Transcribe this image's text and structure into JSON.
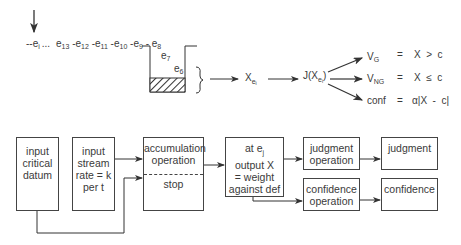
{
  "top": {
    "stream_prefix": "--e",
    "stream_prefix_sub": "i",
    "ellipsis": "...",
    "stream_elements": [
      {
        "base": "e",
        "sub": "13"
      },
      {
        "base": "-e",
        "sub": "12"
      },
      {
        "base": "-e",
        "sub": "11"
      },
      {
        "base": "-e",
        "sub": "10"
      },
      {
        "base": "-e",
        "sub": "9"
      },
      {
        "base": " - e",
        "sub": "8"
      }
    ],
    "container_items": [
      {
        "base": "e",
        "sub": "7"
      },
      {
        "base": "e",
        "sub": "6"
      }
    ],
    "x_label": {
      "base": "X",
      "sub": "e",
      "subsub": "i"
    },
    "j_label": {
      "base": "J(X",
      "sub": "e",
      "subsub": "i",
      "close": ")"
    },
    "outcomes": [
      {
        "name": "V",
        "sub": "G",
        "eq": "=",
        "expr": "X  >  c"
      },
      {
        "name": "V",
        "sub": "NG",
        "eq": "=",
        "expr": "X  ≤  c"
      },
      {
        "name": "conf",
        "sub": "",
        "eq": "=",
        "expr": "α|X  -  c|"
      }
    ]
  },
  "boxes": {
    "critical_datum": [
      "input",
      "critical",
      "datum"
    ],
    "input_stream": [
      "input",
      "stream",
      "rate = k",
      "per  t"
    ],
    "accumulation": {
      "upper": [
        "accumulation",
        "operation"
      ],
      "lower": "stop"
    },
    "output": [
      "at  e",
      "output  X",
      "= weight",
      "against def"
    ],
    "output_sub": "j",
    "judgment_operation": [
      "judgment",
      "operation"
    ],
    "judgment": "judgment",
    "confidence_operation": [
      "confidence",
      "operation"
    ],
    "confidence": "confidence"
  },
  "colors": {
    "stroke": "#444444",
    "text": "#3a3a3a"
  }
}
